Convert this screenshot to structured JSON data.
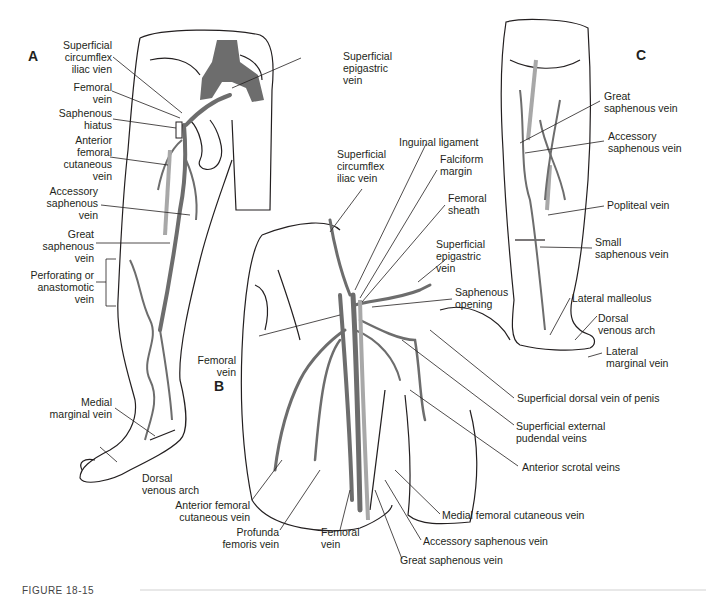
{
  "figure": {
    "caption": "FIGURE 18-15",
    "colors": {
      "vein": "#6d6d6d",
      "light_vein": "#a8a8a8",
      "line": "#231f20",
      "background": "#ffffff"
    }
  },
  "panels": {
    "A": {
      "letter": "A",
      "labels": [
        "Superficial\ncircumflex\niliac vien",
        "Femoral\nvein",
        "Saphenous\nhiatus",
        "Anterior\nfemoral\ncutaneous\nvein",
        "Accessory\nsaphenous\nvein",
        "Great\nsaphenous\nvein",
        "Perforating or\nanastomotic\nvein",
        "Superficial\nepigastric\nvein",
        "Medial\nmarginal vein",
        "Dorsal\nvenous arch"
      ]
    },
    "B": {
      "letter": "B",
      "labels": [
        "Inguinal ligament",
        "Superficial\ncircumflex\niliac vein",
        "Falciform\nmargin",
        "Femoral\nsheath",
        "Superficial\nepigastric\nvein",
        "Saphenous\nopening",
        "Femoral\nvein",
        "Superficial dorsal vein of penis",
        "Superficial external\npudendal veins",
        "Anterior scrotal veins",
        "Anterior femoral\ncutaneous vein",
        "Profunda\nfemoris vein",
        "Femoral\nvein",
        "Medial femoral cutaneous vein",
        "Accessory saphenous vein",
        "Great saphenous vein"
      ]
    },
    "C": {
      "letter": "C",
      "labels": [
        "Great\nsaphenous vein",
        "Accessory\nsaphenous vein",
        "Popliteal vein",
        "Small\nsaphenous vein",
        "Lateral malleolus",
        "Dorsal\nvenous arch",
        "Lateral\nmarginal vein"
      ]
    }
  }
}
